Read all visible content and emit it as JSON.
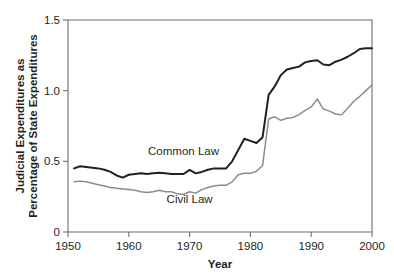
{
  "chart_data": {
    "type": "line",
    "title": "",
    "xlabel": "Year",
    "ylabel": "Judicial Expenditures as Percentage of State Expenditures",
    "ylabel_line1": "Judicial Expenditures as",
    "ylabel_line2": "Percentage of State Expenditures",
    "xlim": [
      1950,
      2000
    ],
    "ylim": [
      0,
      1.5
    ],
    "xticks": [
      1950,
      1960,
      1970,
      1980,
      1990,
      2000
    ],
    "xtick_labels": [
      "1950",
      "1960",
      "1970",
      "1980",
      "1990",
      "2000"
    ],
    "yticks": [
      0,
      0.5,
      1.0,
      1.5
    ],
    "ytick_labels": [
      "0",
      "0.5",
      "1.0",
      "1.5"
    ],
    "grid": false,
    "legend_position": "inline-annotation",
    "x": [
      1951,
      1952,
      1953,
      1954,
      1955,
      1956,
      1957,
      1958,
      1959,
      1960,
      1961,
      1962,
      1963,
      1964,
      1965,
      1966,
      1967,
      1968,
      1969,
      1970,
      1971,
      1972,
      1973,
      1974,
      1975,
      1976,
      1977,
      1978,
      1979,
      1980,
      1981,
      1982,
      1983,
      1984,
      1985,
      1986,
      1987,
      1988,
      1989,
      1990,
      1991,
      1992,
      1993,
      1994,
      1995,
      1996,
      1997,
      1998,
      1999,
      2000
    ],
    "series": [
      {
        "name": "Common Law",
        "color": "#231f20",
        "label_x": 1969,
        "label_y": 0.545,
        "values": [
          0.45,
          0.465,
          0.46,
          0.455,
          0.45,
          0.44,
          0.425,
          0.4,
          0.385,
          0.405,
          0.41,
          0.415,
          0.41,
          0.415,
          0.42,
          0.415,
          0.41,
          0.41,
          0.41,
          0.44,
          0.415,
          0.425,
          0.44,
          0.45,
          0.45,
          0.45,
          0.5,
          0.58,
          0.66,
          0.645,
          0.63,
          0.67,
          0.97,
          1.03,
          1.11,
          1.15,
          1.16,
          1.17,
          1.2,
          1.21,
          1.215,
          1.185,
          1.18,
          1.205,
          1.22,
          1.24,
          1.265,
          1.295,
          1.3,
          1.3
        ]
      },
      {
        "name": "Civil Law",
        "color": "#8c8c8c",
        "label_x": 1970,
        "label_y": 0.205,
        "values": [
          0.355,
          0.36,
          0.355,
          0.345,
          0.335,
          0.325,
          0.315,
          0.31,
          0.305,
          0.3,
          0.295,
          0.285,
          0.28,
          0.285,
          0.295,
          0.285,
          0.285,
          0.27,
          0.265,
          0.285,
          0.275,
          0.3,
          0.315,
          0.325,
          0.33,
          0.33,
          0.355,
          0.405,
          0.415,
          0.415,
          0.43,
          0.47,
          0.8,
          0.815,
          0.79,
          0.805,
          0.81,
          0.83,
          0.86,
          0.885,
          0.94,
          0.87,
          0.855,
          0.835,
          0.83,
          0.875,
          0.925,
          0.96,
          1.0,
          1.04
        ]
      }
    ]
  }
}
